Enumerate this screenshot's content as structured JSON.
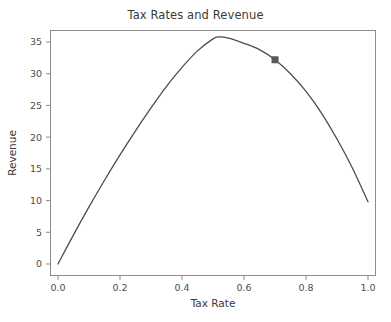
{
  "chart_data": {
    "type": "line",
    "title": "Tax Rates and Revenue",
    "xlabel": "Tax Rate",
    "ylabel": "Revenue",
    "xlim": [
      -0.04,
      1.04
    ],
    "ylim": [
      -1.8,
      37.8
    ],
    "xticks": [
      "0.0",
      "0.2",
      "0.4",
      "0.6",
      "0.8",
      "1.0"
    ],
    "xtick_values": [
      0.0,
      0.2,
      0.4,
      0.6,
      0.8,
      1.0
    ],
    "yticks": [
      "0",
      "5",
      "10",
      "15",
      "20",
      "25",
      "30",
      "35"
    ],
    "ytick_values": [
      0,
      5,
      10,
      15,
      20,
      25,
      30,
      35
    ],
    "grid": false,
    "legend": false,
    "line_color": "#4d4d4d",
    "marker_color": "#5a5a5a",
    "series": [
      {
        "name": "Revenue curve",
        "x": [
          0.0,
          0.05,
          0.1,
          0.15,
          0.2,
          0.25,
          0.3,
          0.35,
          0.4,
          0.45,
          0.5,
          0.52,
          0.55,
          0.6,
          0.65,
          0.7,
          0.75,
          0.8,
          0.85,
          0.9,
          0.95,
          1.0
        ],
        "values": [
          0.0,
          4.6,
          9.0,
          13.2,
          17.2,
          21.0,
          24.6,
          28.0,
          31.0,
          33.6,
          35.5,
          35.8,
          35.6,
          34.8,
          33.8,
          32.2,
          30.0,
          27.2,
          23.8,
          19.7,
          15.1,
          9.8
        ]
      }
    ],
    "annotations": [
      {
        "name": "highlighted-point",
        "marker": "square",
        "x": 0.7,
        "y": 32.2
      }
    ]
  },
  "figure": {
    "bottom_artifact_text": ""
  }
}
